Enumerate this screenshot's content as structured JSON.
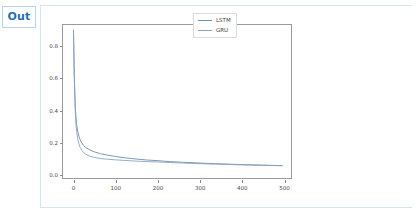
{
  "notebook": {
    "out_prompt": "Out"
  },
  "chart_data": {
    "type": "line",
    "title": "",
    "xlabel": "",
    "ylabel": "",
    "xlim": [
      -25,
      520
    ],
    "ylim": [
      -0.03,
      0.93
    ],
    "grid": false,
    "legend_position": "upper right",
    "xticks": [
      "0",
      "100",
      "200",
      "300",
      "400",
      "500"
    ],
    "xtick_values": [
      0,
      100,
      200,
      300,
      400,
      500
    ],
    "yticks": [
      "0.0",
      "0.2",
      "0.4",
      "0.6",
      "0.8"
    ],
    "ytick_values": [
      0.0,
      0.2,
      0.4,
      0.6,
      0.8
    ],
    "colors": {
      "lstm": "#6b8fb5",
      "gru": "#8fa3b8",
      "axes": "#9a9a9a",
      "tick_text": "#4a4a4a",
      "out_prompt": "#1f6fb5",
      "cell_border": "#d6e6f0"
    },
    "series": [
      {
        "name": "LSTM",
        "color": "#6b8fb5",
        "x": [
          0,
          2,
          4,
          6,
          8,
          10,
          13,
          16,
          20,
          25,
          30,
          40,
          50,
          65,
          80,
          100,
          125,
          150,
          175,
          200,
          230,
          260,
          300,
          340,
          380,
          420,
          460,
          500
        ],
        "values": [
          0.9,
          0.62,
          0.44,
          0.35,
          0.3,
          0.265,
          0.232,
          0.21,
          0.19,
          0.172,
          0.16,
          0.145,
          0.134,
          0.122,
          0.114,
          0.105,
          0.096,
          0.089,
          0.083,
          0.079,
          0.073,
          0.069,
          0.064,
          0.06,
          0.056,
          0.053,
          0.05,
          0.048
        ]
      },
      {
        "name": "GRU",
        "color": "#8fa3b8",
        "x": [
          0,
          2,
          4,
          6,
          8,
          10,
          13,
          16,
          20,
          25,
          30,
          40,
          50,
          65,
          80,
          100,
          125,
          150,
          175,
          200,
          230,
          260,
          300,
          340,
          380,
          420,
          460,
          500
        ],
        "values": [
          0.9,
          0.6,
          0.41,
          0.31,
          0.255,
          0.218,
          0.184,
          0.162,
          0.143,
          0.128,
          0.118,
          0.106,
          0.099,
          0.092,
          0.088,
          0.084,
          0.08,
          0.076,
          0.073,
          0.071,
          0.067,
          0.064,
          0.06,
          0.057,
          0.054,
          0.051,
          0.049,
          0.047
        ]
      }
    ]
  }
}
